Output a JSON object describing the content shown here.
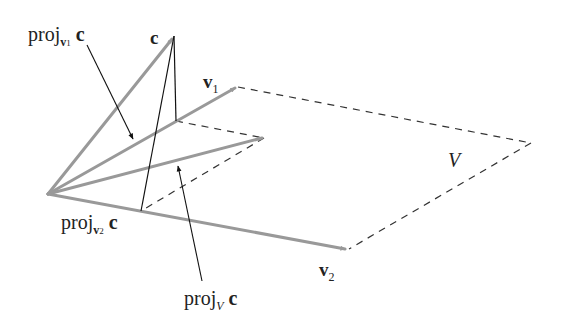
{
  "diagram": {
    "labels": {
      "c": "c",
      "v1_main": "v",
      "v1_sub": "1",
      "v2_main": "v",
      "v2_sub": "2",
      "V": "V",
      "proj_v1_prefix": "proj",
      "proj_v1_sub_main": "v",
      "proj_v1_sub_num": "1",
      "proj_v1_vec": "c",
      "proj_v2_prefix": "proj",
      "proj_v2_sub_main": "v",
      "proj_v2_sub_num": "2",
      "proj_v2_vec": "c",
      "proj_V_prefix": "proj",
      "proj_V_sub": "V",
      "proj_V_vec": "c"
    },
    "points": {
      "origin": [
        48,
        194
      ],
      "c": [
        174,
        36
      ],
      "v1_tip": [
        236,
        87
      ],
      "v2_tip": [
        347,
        249
      ],
      "proj_v1": [
        176,
        121
      ],
      "proj_v2": [
        141,
        211
      ],
      "proj_V": [
        264,
        138
      ],
      "plane_far_corner": [
        531,
        143
      ]
    },
    "colors": {
      "vector": "#999999",
      "thin_line": "#111111",
      "dashed": "#333333",
      "text": "#222222"
    }
  }
}
